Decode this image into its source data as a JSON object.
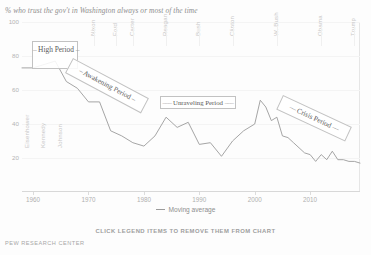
{
  "chart_data": {
    "type": "line",
    "title": "% who trust the gov't in Washington always or most of the time",
    "xlabel": "",
    "ylabel": "",
    "xlim": [
      1958,
      2019
    ],
    "ylim": [
      0,
      100
    ],
    "yticks": [
      0,
      20,
      40,
      60,
      80,
      100
    ],
    "xticks": [
      1960,
      1970,
      1980,
      1990,
      2000,
      2010
    ],
    "grid": false,
    "legend_position": "bottom-center",
    "series": [
      {
        "name": "Moving average",
        "color": "#9b9b9b",
        "x": [
          1958,
          1960,
          1962,
          1964,
          1966,
          1968,
          1970,
          1972,
          1974,
          1976,
          1978,
          1980,
          1982,
          1984,
          1986,
          1988,
          1990,
          1992,
          1994,
          1996,
          1998,
          2000,
          2001,
          2002,
          2003,
          2004,
          2005,
          2006,
          2007,
          2008,
          2009,
          2010,
          2011,
          2012,
          2013,
          2014,
          2015,
          2016,
          2017,
          2018,
          2019
        ],
        "values": [
          73,
          73,
          75,
          77,
          65,
          61,
          53,
          53,
          36,
          33,
          29,
          27,
          33,
          44,
          38,
          41,
          28,
          29,
          21,
          30,
          36,
          40,
          54,
          50,
          42,
          44,
          33,
          32,
          29,
          26,
          23,
          22,
          18,
          22,
          19,
          24,
          19,
          19,
          18,
          18,
          17
        ]
      }
    ],
    "presidents": [
      {
        "name": "Eisenhower",
        "year": 1959
      },
      {
        "name": "Kennedy",
        "year": 1962
      },
      {
        "name": "Johnson",
        "year": 1965
      },
      {
        "name": "Nixon",
        "year": 1971
      },
      {
        "name": "Ford",
        "year": 1975
      },
      {
        "name": "Carter",
        "year": 1978
      },
      {
        "name": "Reagan",
        "year": 1984
      },
      {
        "name": "Bush",
        "year": 1990
      },
      {
        "name": "Clinton",
        "year": 1996
      },
      {
        "name": "W. Bush",
        "year": 2004
      },
      {
        "name": "Obama",
        "year": 2012
      },
      {
        "name": "Trump",
        "year": 2018
      }
    ],
    "annotations": [
      {
        "label": "High Period",
        "dash_left": "–",
        "dash_right": "–"
      },
      {
        "label": "Awakening Period",
        "dash_left": "–",
        "dash_right": "–"
      },
      {
        "label": "Unraveling Period",
        "dash_left": "–––",
        "dash_right": "–––"
      },
      {
        "label": "Crisis Period",
        "dash_left": "––",
        "dash_right": "––"
      }
    ]
  },
  "legend": {
    "items": [
      {
        "label": "Moving average",
        "color": "#9b9b9b"
      }
    ]
  },
  "hint_text": "CLICK LEGEND ITEMS TO REMOVE THEM FROM CHART",
  "source": "PEW RESEARCH CENTER"
}
